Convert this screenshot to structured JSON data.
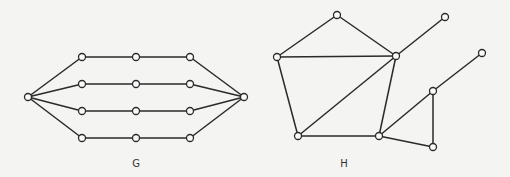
{
  "graphs": [
    {
      "id": "G",
      "label": "G",
      "label_pos": [
        136,
        167
      ],
      "nodes": [
        {
          "id": "L",
          "x": 28,
          "y": 97
        },
        {
          "id": "a1",
          "x": 82,
          "y": 57
        },
        {
          "id": "a2",
          "x": 136,
          "y": 57
        },
        {
          "id": "a3",
          "x": 190,
          "y": 57
        },
        {
          "id": "b1",
          "x": 82,
          "y": 84
        },
        {
          "id": "b2",
          "x": 136,
          "y": 84
        },
        {
          "id": "b3",
          "x": 190,
          "y": 84
        },
        {
          "id": "c1",
          "x": 82,
          "y": 111
        },
        {
          "id": "c2",
          "x": 136,
          "y": 111
        },
        {
          "id": "c3",
          "x": 190,
          "y": 111
        },
        {
          "id": "d1",
          "x": 82,
          "y": 138
        },
        {
          "id": "d2",
          "x": 136,
          "y": 138
        },
        {
          "id": "d3",
          "x": 190,
          "y": 138
        },
        {
          "id": "R",
          "x": 244,
          "y": 97
        }
      ],
      "edges": [
        [
          "L",
          "a1"
        ],
        [
          "a1",
          "a2"
        ],
        [
          "a2",
          "a3"
        ],
        [
          "a3",
          "R"
        ],
        [
          "L",
          "b1"
        ],
        [
          "b1",
          "b2"
        ],
        [
          "b2",
          "b3"
        ],
        [
          "b3",
          "R"
        ],
        [
          "L",
          "c1"
        ],
        [
          "c1",
          "c2"
        ],
        [
          "c2",
          "c3"
        ],
        [
          "c3",
          "R"
        ],
        [
          "L",
          "d1"
        ],
        [
          "d1",
          "d2"
        ],
        [
          "d2",
          "d3"
        ],
        [
          "d3",
          "R"
        ]
      ]
    },
    {
      "id": "H",
      "label": "H",
      "label_pos": [
        344,
        167
      ],
      "nodes": [
        {
          "id": "top",
          "x": 337,
          "y": 15
        },
        {
          "id": "left",
          "x": 277,
          "y": 57
        },
        {
          "id": "hub",
          "x": 396,
          "y": 56
        },
        {
          "id": "pend1",
          "x": 445,
          "y": 17
        },
        {
          "id": "bl",
          "x": 298,
          "y": 136
        },
        {
          "id": "bc",
          "x": 379,
          "y": 136
        },
        {
          "id": "tt",
          "x": 433,
          "y": 91
        },
        {
          "id": "pend2",
          "x": 482,
          "y": 53
        },
        {
          "id": "tb",
          "x": 433,
          "y": 147
        }
      ],
      "edges": [
        [
          "top",
          "left"
        ],
        [
          "top",
          "hub"
        ],
        [
          "left",
          "hub"
        ],
        [
          "left",
          "bl"
        ],
        [
          "hub",
          "bl"
        ],
        [
          "hub",
          "bc"
        ],
        [
          "hub",
          "pend1"
        ],
        [
          "bl",
          "bc"
        ],
        [
          "bc",
          "tt"
        ],
        [
          "bc",
          "tb"
        ],
        [
          "tt",
          "tb"
        ],
        [
          "tt",
          "pend2"
        ]
      ]
    }
  ],
  "style": {
    "line_color": "#2a2a2a",
    "node_fill": "#fafafa",
    "background": "#f4f4f2",
    "node_radius": 3.5
  }
}
